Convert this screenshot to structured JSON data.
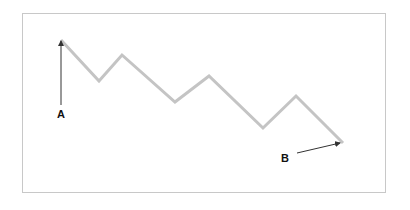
{
  "diagram": {
    "line_color": "#c4c4c4",
    "arrow_color": "#333333",
    "frame_color": "#c8c8c8",
    "polyline_points": [
      [
        61,
        40
      ],
      [
        99,
        81
      ],
      [
        122,
        55
      ],
      [
        175,
        102
      ],
      [
        209,
        76
      ],
      [
        263,
        128
      ],
      [
        296,
        96
      ],
      [
        343,
        143
      ]
    ],
    "labels": {
      "a": {
        "text": "A",
        "x": 57,
        "y": 108,
        "arrow_from": [
          61,
          105
        ],
        "arrow_to": [
          61,
          41
        ]
      },
      "b": {
        "text": "B",
        "x": 281,
        "y": 152,
        "arrow_from": [
          297,
          153
        ],
        "arrow_to": [
          340,
          143
        ]
      }
    }
  }
}
